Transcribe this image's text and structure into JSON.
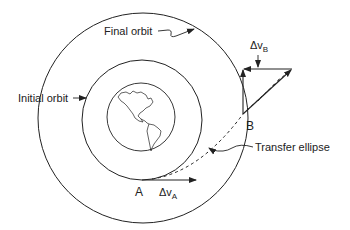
{
  "colors": {
    "ink": "#222222",
    "background": "#ffffff"
  },
  "labels": {
    "final_orbit": "Final orbit",
    "initial_orbit": "Initial orbit",
    "transfer_ellipse": "Transfer ellipse",
    "point_a": "A",
    "point_b": "B",
    "delta_v_a_prefix": "Δv",
    "delta_v_a_sub": "A",
    "delta_v_b_prefix": "Δv",
    "delta_v_b_sub": "B"
  },
  "elements": {
    "earth": "earth-globe-icon",
    "initial_orbit": "circle",
    "final_orbit": "circle",
    "transfer_ellipse": "dashed-arc"
  }
}
